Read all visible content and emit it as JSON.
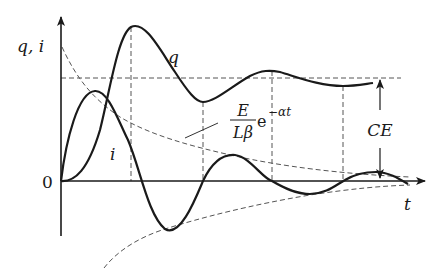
{
  "diagram": {
    "type": "damped-oscillation-plot",
    "axes": {
      "y_label": "q, i",
      "x_label": "t",
      "origin_label": "0"
    },
    "curves": {
      "charge_label": "q",
      "current_label": "i"
    },
    "envelope": {
      "numerator": "E",
      "denominator": "Lβ",
      "base": "e",
      "exponent": "−αt"
    },
    "steady_state": {
      "label": "CE"
    },
    "colors": {
      "stroke": "#1a1a1a",
      "dashed": "#555555",
      "background": "#ffffff"
    }
  }
}
